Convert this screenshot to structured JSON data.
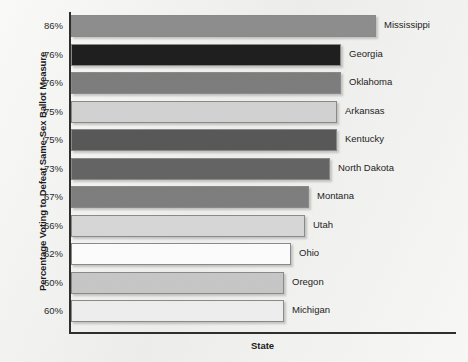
{
  "chart_data": {
    "type": "bar",
    "orientation": "horizontal",
    "title": "",
    "xlabel": "State",
    "ylabel": "Percentage Voting to Defeat Same-Sex Ballot Measure",
    "categories": [
      "Mississippi",
      "Georgia",
      "Oklahoma",
      "Arkansas",
      "Kentucky",
      "North Dakota",
      "Montana",
      "Utah",
      "Ohio",
      "Oregon",
      "Michigan"
    ],
    "values": [
      86,
      76,
      76,
      75,
      75,
      73,
      67,
      66,
      62,
      60,
      60
    ],
    "tick_labels": [
      "86%",
      "76%",
      "76%",
      "75%",
      "75%",
      "73%",
      "67%",
      "66%",
      "62%",
      "60%",
      "60%"
    ],
    "value_suffix": "%",
    "xlim": [
      0,
      86
    ],
    "grid": false,
    "legend": false,
    "bar_colors": [
      "#8d8d8d",
      "#1f1f1f",
      "#7d7d7d",
      "#d1d1d1",
      "#585858",
      "#646464",
      "#7e7e7e",
      "#d6d6d6",
      "#fbfbfb",
      "#c6c6c6",
      "#ededed"
    ],
    "bars": [
      {
        "label": "Mississippi",
        "value": 86,
        "tick": "86%",
        "color": "#8d8d8d"
      },
      {
        "label": "Georgia",
        "value": 76,
        "tick": "76%",
        "color": "#1f1f1f"
      },
      {
        "label": "Oklahoma",
        "value": 76,
        "tick": "76%",
        "color": "#7d7d7d"
      },
      {
        "label": "Arkansas",
        "value": 75,
        "tick": "75%",
        "color": "#d1d1d1"
      },
      {
        "label": "Kentucky",
        "value": 75,
        "tick": "75%",
        "color": "#585858"
      },
      {
        "label": "North Dakota",
        "value": 73,
        "tick": "73%",
        "color": "#646464"
      },
      {
        "label": "Montana",
        "value": 67,
        "tick": "67%",
        "color": "#7e7e7e"
      },
      {
        "label": "Utah",
        "value": 66,
        "tick": "66%",
        "color": "#d6d6d6"
      },
      {
        "label": "Ohio",
        "value": 62,
        "tick": "62%",
        "color": "#fbfbfb"
      },
      {
        "label": "Oregon",
        "value": 60,
        "tick": "60%",
        "color": "#c6c6c6"
      },
      {
        "label": "Michigan",
        "value": 60,
        "tick": "60%",
        "color": "#ededed"
      }
    ],
    "axis_color": "#2e2e2e",
    "background_color": "#efefed"
  }
}
